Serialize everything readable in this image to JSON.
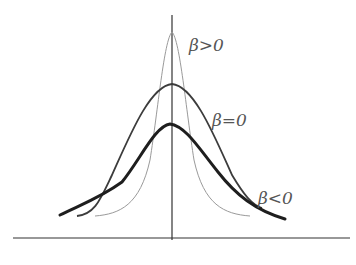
{
  "figure": {
    "axes": {
      "horizontal": true,
      "vertical": true
    },
    "curves": [
      {
        "name": "beta-positive",
        "label": "β>0",
        "stroke": "#9a9a9a",
        "width": 1.0
      },
      {
        "name": "beta-zero",
        "label": "β=0",
        "stroke": "#3c3c3c",
        "width": 1.8
      },
      {
        "name": "beta-negative",
        "label": "β<0",
        "stroke": "#1e1e1e",
        "width": 3.0
      }
    ],
    "labels": {
      "beta_positive": "β>0",
      "beta_zero": "β=0",
      "beta_negative": "β<0"
    }
  }
}
